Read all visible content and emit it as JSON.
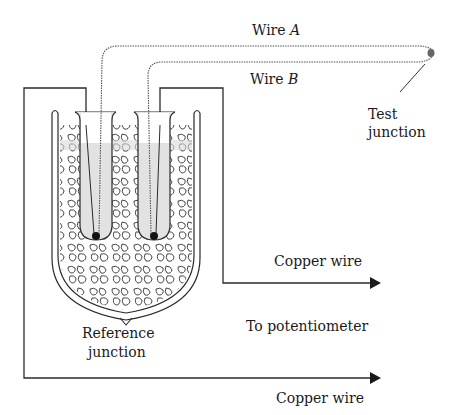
{
  "diagram": {
    "type": "thermocouple-setup",
    "labels": {
      "wire_a": "Wire ",
      "wire_a_var": "A",
      "wire_b": "Wire ",
      "wire_b_var": "B",
      "test_junction_line1": "Test",
      "test_junction_line2": "junction",
      "reference_junction_line1": "Reference",
      "reference_junction_line2": "junction",
      "copper_wire_upper": "Copper wire",
      "copper_wire_lower": "Copper wire",
      "to_potentiometer": "To potentiometer"
    },
    "colors": {
      "line": "#2a2a2a",
      "liquid": "#d8d8d8",
      "background": "#ffffff",
      "wire_dotted": "#555555"
    }
  }
}
